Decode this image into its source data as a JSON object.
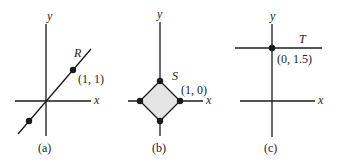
{
  "figure": {
    "panels": [
      {
        "id": "a",
        "caption": "(a)",
        "x_axis_label": "x",
        "y_axis_label": "y",
        "region_label": "R",
        "point_label": "(1, 1)",
        "description": "Line y = x through origin with marked points (1,1) and (-1,-1)"
      },
      {
        "id": "b",
        "caption": "(b)",
        "x_axis_label": "x",
        "y_axis_label": "y",
        "region_label": "S",
        "point_label": "(1, 0)",
        "description": "Shaded diamond |x|+|y| <= 1 with vertices (1,0), (0,1), (-1,0), (0,-1)",
        "fill_color": "#e4e4e4"
      },
      {
        "id": "c",
        "caption": "(c)",
        "x_axis_label": "x",
        "y_axis_label": "y",
        "region_label": "T",
        "point_label": "(0, 1.5)",
        "description": "Horizontal line y = 1.5 with marked point (0, 1.5)"
      }
    ],
    "colors": {
      "line": "#1a1a1a",
      "shade": "#e4e4e4"
    }
  }
}
